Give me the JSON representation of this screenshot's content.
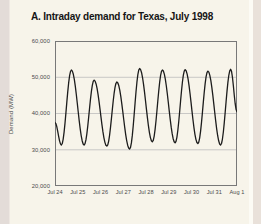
{
  "colors": {
    "page_bg": "#f7f4ea",
    "edge_left": "#e3dcd8",
    "edge_right": "#e9e1da",
    "edge_highlight": "#fcfbf5",
    "grid": "#bdbdbd",
    "frame": "#787878",
    "tick_text": "#4a4a4a",
    "title_text": "#151515",
    "line": "#1c1c1c"
  },
  "chart_data": {
    "type": "line",
    "title": "A. Intraday demand for Texas, July 1998",
    "ylabel": "Demand (MW)",
    "xlabel": "",
    "ylim": [
      20000,
      60000
    ],
    "xlim_days": [
      0,
      8
    ],
    "grid": "horizontal",
    "legend": "none",
    "y_tick_values": [
      60000,
      50000,
      40000,
      30000,
      20000
    ],
    "y_tick_labels": [
      "60,000",
      "50,000",
      "40,000",
      "30,000",
      "20,000"
    ],
    "x_tick_labels": [
      "Jul 24",
      "Jul 25",
      "Jul 26",
      "Jul 27",
      "Jul 28",
      "Jul 29",
      "Jul 30",
      "Jul 31",
      "Aug 1"
    ],
    "series": [
      {
        "name": "Texas intraday electricity demand (MW)",
        "points": [
          {
            "d": 0.0,
            "v": 37500
          },
          {
            "d": 0.28,
            "v": 31300
          },
          {
            "d": 0.72,
            "v": 52000
          },
          {
            "d": 1.28,
            "v": 31300
          },
          {
            "d": 1.72,
            "v": 49200
          },
          {
            "d": 2.28,
            "v": 31000
          },
          {
            "d": 2.72,
            "v": 48700
          },
          {
            "d": 3.28,
            "v": 30200
          },
          {
            "d": 3.72,
            "v": 52400
          },
          {
            "d": 4.28,
            "v": 32200
          },
          {
            "d": 4.72,
            "v": 52000
          },
          {
            "d": 5.28,
            "v": 31900
          },
          {
            "d": 5.72,
            "v": 52100
          },
          {
            "d": 6.28,
            "v": 31700
          },
          {
            "d": 6.72,
            "v": 51700
          },
          {
            "d": 7.28,
            "v": 31300
          },
          {
            "d": 7.72,
            "v": 52200
          },
          {
            "d": 8.0,
            "v": 40500
          }
        ]
      }
    ]
  }
}
